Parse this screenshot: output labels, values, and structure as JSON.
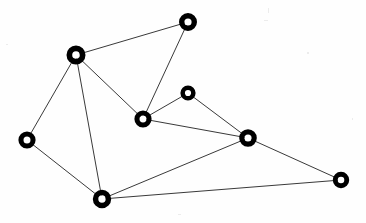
{
  "figure": {
    "width": 366,
    "height": 223,
    "background_color": "#fefefe"
  },
  "style": {
    "node_stroke_color": "#000000",
    "node_fill_color": "#ffffff",
    "edge_color": "#222222",
    "edge_width": 0.9
  },
  "chart_data": {
    "type": "diagram",
    "subtype": "node-link-graph",
    "directed": false,
    "weighted": false,
    "node_count": 8,
    "edge_count": 12,
    "title": "",
    "xlabel": "",
    "ylabel": "",
    "grid": false,
    "legend": "none",
    "xlim": [
      0,
      366
    ],
    "ylim": [
      0,
      223
    ],
    "nodes": [
      {
        "id": "n1",
        "label": "",
        "x": 188,
        "y": 22,
        "r_outer": 9.0,
        "r_inner": 3.6,
        "degree": 2,
        "position_name": "top"
      },
      {
        "id": "n2",
        "label": "",
        "x": 76,
        "y": 55,
        "r_outer": 9.5,
        "r_inner": 3.8,
        "degree": 4,
        "position_name": "upper-left"
      },
      {
        "id": "n3",
        "label": "",
        "x": 188,
        "y": 93,
        "r_outer": 7.6,
        "r_inner": 3.1,
        "degree": 2,
        "position_name": "upper-middle-right"
      },
      {
        "id": "n4",
        "label": "",
        "x": 143,
        "y": 119,
        "r_outer": 8.6,
        "r_inner": 3.5,
        "degree": 4,
        "position_name": "center"
      },
      {
        "id": "n5",
        "label": "",
        "x": 27,
        "y": 140,
        "r_outer": 8.6,
        "r_inner": 3.5,
        "degree": 2,
        "position_name": "left"
      },
      {
        "id": "n6",
        "label": "",
        "x": 248,
        "y": 138,
        "r_outer": 8.8,
        "r_inner": 3.6,
        "degree": 5,
        "position_name": "right"
      },
      {
        "id": "n7",
        "label": "",
        "x": 102,
        "y": 199,
        "r_outer": 9.2,
        "r_inner": 3.7,
        "degree": 4,
        "position_name": "bottom"
      },
      {
        "id": "n8",
        "label": "",
        "x": 341,
        "y": 180,
        "r_outer": 8.2,
        "r_inner": 3.3,
        "degree": 2,
        "position_name": "bottom-right"
      }
    ],
    "edges": [
      {
        "id": "e1",
        "source": "n1",
        "target": "n2"
      },
      {
        "id": "e2",
        "source": "n1",
        "target": "n4"
      },
      {
        "id": "e3",
        "source": "n2",
        "target": "n4"
      },
      {
        "id": "e4",
        "source": "n2",
        "target": "n5"
      },
      {
        "id": "e5",
        "source": "n2",
        "target": "n7"
      },
      {
        "id": "e6",
        "source": "n5",
        "target": "n7"
      },
      {
        "id": "e7",
        "source": "n4",
        "target": "n3"
      },
      {
        "id": "e8",
        "source": "n4",
        "target": "n6"
      },
      {
        "id": "e9",
        "source": "n3",
        "target": "n6"
      },
      {
        "id": "e10",
        "source": "n6",
        "target": "n7"
      },
      {
        "id": "e11",
        "source": "n6",
        "target": "n8"
      },
      {
        "id": "e12",
        "source": "n7",
        "target": "n8"
      }
    ],
    "specks": [
      {
        "x": 268,
        "y": 8,
        "w": 1,
        "h": 5
      },
      {
        "x": 264,
        "y": 20,
        "w": 4,
        "h": 1
      },
      {
        "x": 307,
        "y": 52,
        "w": 2,
        "h": 2
      },
      {
        "x": 6,
        "y": 44,
        "w": 2,
        "h": 1
      },
      {
        "x": 178,
        "y": 214,
        "w": 3,
        "h": 1
      },
      {
        "x": 352,
        "y": 118,
        "w": 1,
        "h": 2
      }
    ]
  }
}
